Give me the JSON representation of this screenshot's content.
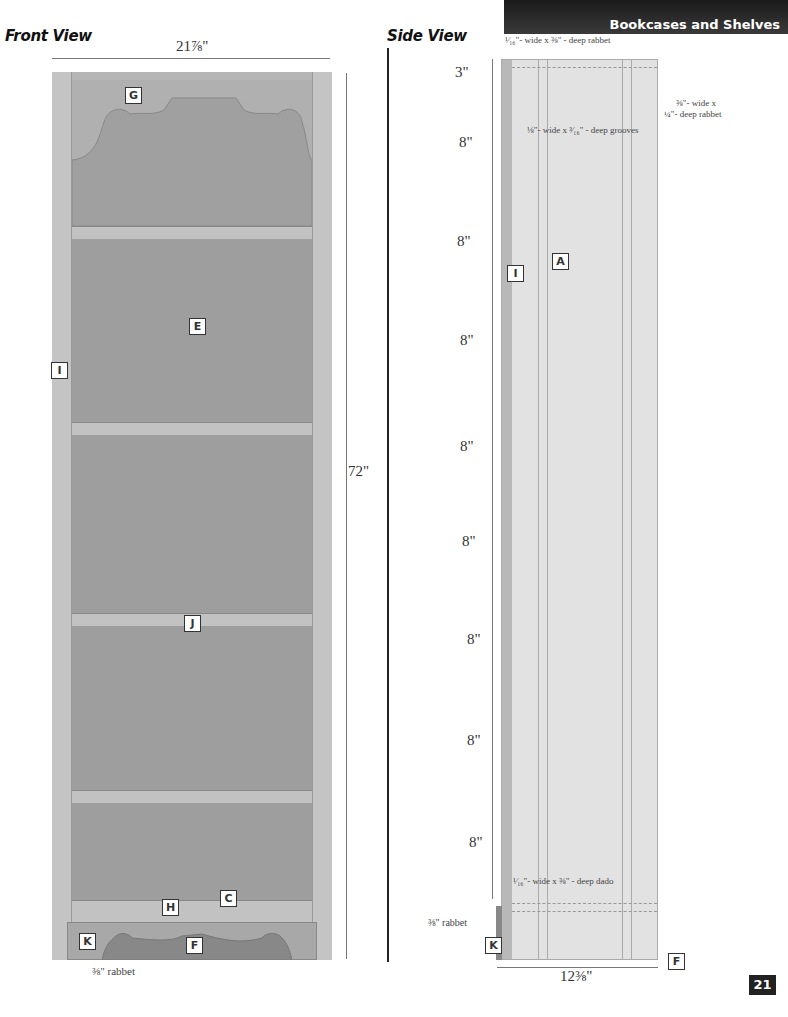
{
  "header": {
    "section_title": "Bookcases and Shelves"
  },
  "front_view": {
    "title": "Front View",
    "width_dim": "21⅞\"",
    "height_dim": "72\"",
    "rabbet_note": "⅜\" rabbet",
    "part_labels": [
      "G",
      "E",
      "I",
      "J",
      "H",
      "C",
      "K",
      "F"
    ]
  },
  "side_view": {
    "title": "Side View",
    "depth_dim": "12⅜\"",
    "spacing_dims": [
      "3\"",
      "8\"",
      "8\"",
      "8\"",
      "8\"",
      "8\"",
      "8\"",
      "8\"",
      "8\""
    ],
    "notes": {
      "top_rabbet": "¹⁄₁₆\"- wide x ⅜\" - deep rabbet",
      "back_rabbet_1": "⅜\"- wide x",
      "back_rabbet_2": "¼\"- deep rabbet",
      "grooves": "⅛\"- wide x ³⁄₁₆\" - deep grooves",
      "dado": "¹⁄₁₆\"- wide x ⅜\" - deep dado",
      "rabbet": "⅜\" rabbet"
    },
    "part_labels": [
      "I",
      "A",
      "K",
      "F"
    ]
  },
  "page_number": "21",
  "colors": {
    "panel_dark": "#9a9a9a",
    "panel_mid": "#b5b5b5",
    "panel_light": "#dedede",
    "header_bg": "#2a2a2a"
  }
}
